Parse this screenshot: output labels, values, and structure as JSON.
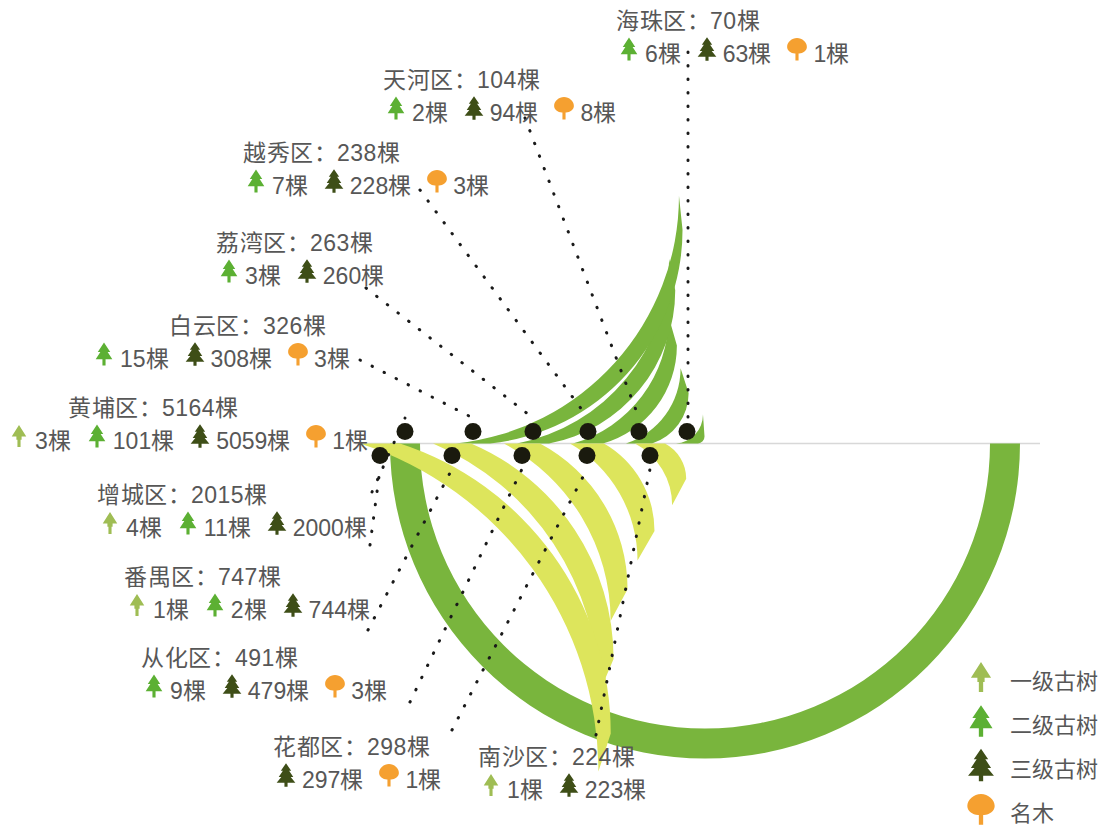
{
  "chart_data": {
    "type": "bar",
    "title": "",
    "subtitle": "",
    "xlabel": "",
    "ylabel": "",
    "legend_position": "bottom-right",
    "grid": false,
    "unit": "棵",
    "categories": [
      "黄埔区",
      "白云区",
      "荔湾区",
      "越秀区",
      "天河区",
      "海珠区",
      "增城区",
      "番禺区",
      "从化区",
      "花都区",
      "南沙区"
    ],
    "values": [
      5164,
      326,
      263,
      238,
      104,
      70,
      2015,
      747,
      491,
      298,
      224
    ],
    "series": [
      {
        "name": "一级古树",
        "color": "#9fbd54",
        "values": [
          3,
          0,
          0,
          0,
          0,
          0,
          4,
          1,
          0,
          0,
          1
        ]
      },
      {
        "name": "二级古树",
        "color": "#5cb033",
        "values": [
          101,
          15,
          3,
          7,
          2,
          6,
          11,
          2,
          9,
          0,
          0
        ]
      },
      {
        "name": "三级古树",
        "color": "#3e4e17",
        "values": [
          5059,
          308,
          260,
          228,
          94,
          63,
          2000,
          744,
          479,
          297,
          223
        ]
      },
      {
        "name": "名木",
        "color": "#f5a030",
        "values": [
          1,
          3,
          0,
          3,
          8,
          1,
          0,
          0,
          3,
          1,
          0
        ]
      }
    ]
  },
  "legend": {
    "items": [
      {
        "label": "一级古树",
        "icon": "tree-level1-icon",
        "color": "#9fbd54"
      },
      {
        "label": "二级古树",
        "icon": "tree-level2-icon",
        "color": "#5cb033"
      },
      {
        "label": "三级古树",
        "icon": "tree-level3-icon",
        "color": "#3e4e17"
      },
      {
        "label": "名木",
        "icon": "famous-tree-icon",
        "color": "#f5a030"
      }
    ]
  },
  "districts": [
    {
      "key": "haizhu",
      "title": "海珠区：70棵",
      "total": 70,
      "arc_color": "#79b53d",
      "breakdown": [
        {
          "level": "二级古树",
          "icon": "tree-level2-icon",
          "color": "#5cb033",
          "text": "6棵"
        },
        {
          "level": "三级古树",
          "icon": "tree-level3-icon",
          "color": "#3e4e17",
          "text": "63棵"
        },
        {
          "level": "名木",
          "icon": "famous-tree-icon",
          "color": "#f5a030",
          "text": "1棵"
        }
      ]
    },
    {
      "key": "tianhe",
      "title": "天河区：104棵",
      "total": 104,
      "arc_color": "#79b53d",
      "breakdown": [
        {
          "level": "二级古树",
          "icon": "tree-level2-icon",
          "color": "#5cb033",
          "text": "2棵"
        },
        {
          "level": "三级古树",
          "icon": "tree-level3-icon",
          "color": "#3e4e17",
          "text": "94棵"
        },
        {
          "level": "名木",
          "icon": "famous-tree-icon",
          "color": "#f5a030",
          "text": "8棵"
        }
      ]
    },
    {
      "key": "yuexiu",
      "title": "越秀区：238棵",
      "total": 238,
      "arc_color": "#79b53d",
      "breakdown": [
        {
          "level": "二级古树",
          "icon": "tree-level2-icon",
          "color": "#5cb033",
          "text": "7棵"
        },
        {
          "level": "三级古树",
          "icon": "tree-level3-icon",
          "color": "#3e4e17",
          "text": "228棵"
        },
        {
          "level": "名木",
          "icon": "famous-tree-icon",
          "color": "#f5a030",
          "text": "3棵"
        }
      ]
    },
    {
      "key": "liwan",
      "title": "荔湾区：263棵",
      "total": 263,
      "arc_color": "#79b53d",
      "breakdown": [
        {
          "level": "二级古树",
          "icon": "tree-level2-icon",
          "color": "#5cb033",
          "text": "3棵"
        },
        {
          "level": "三级古树",
          "icon": "tree-level3-icon",
          "color": "#3e4e17",
          "text": "260棵"
        }
      ]
    },
    {
      "key": "baiyun",
      "title": "白云区：326棵",
      "total": 326,
      "arc_color": "#79b53d",
      "breakdown": [
        {
          "level": "二级古树",
          "icon": "tree-level2-icon",
          "color": "#5cb033",
          "text": "15棵"
        },
        {
          "level": "三级古树",
          "icon": "tree-level3-icon",
          "color": "#3e4e17",
          "text": "308棵"
        },
        {
          "level": "名木",
          "icon": "famous-tree-icon",
          "color": "#f5a030",
          "text": "3棵"
        }
      ]
    },
    {
      "key": "huangpu",
      "title": "黄埔区：5164棵",
      "total": 5164,
      "arc_color": "#79b53d",
      "breakdown": [
        {
          "level": "一级古树",
          "icon": "tree-level1-icon",
          "color": "#9fbd54",
          "text": "3棵"
        },
        {
          "level": "二级古树",
          "icon": "tree-level2-icon",
          "color": "#5cb033",
          "text": "101棵"
        },
        {
          "level": "三级古树",
          "icon": "tree-level3-icon",
          "color": "#3e4e17",
          "text": "5059棵"
        },
        {
          "level": "名木",
          "icon": "famous-tree-icon",
          "color": "#f5a030",
          "text": "1棵"
        }
      ]
    },
    {
      "key": "zengcheng",
      "title": "增城区：2015棵",
      "total": 2015,
      "arc_color": "#dde55c",
      "breakdown": [
        {
          "level": "一级古树",
          "icon": "tree-level1-icon",
          "color": "#9fbd54",
          "text": "4棵"
        },
        {
          "level": "二级古树",
          "icon": "tree-level2-icon",
          "color": "#5cb033",
          "text": "11棵"
        },
        {
          "level": "三级古树",
          "icon": "tree-level3-icon",
          "color": "#3e4e17",
          "text": "2000棵"
        }
      ]
    },
    {
      "key": "panyu",
      "title": "番禺区：747棵",
      "total": 747,
      "arc_color": "#dde55c",
      "breakdown": [
        {
          "level": "一级古树",
          "icon": "tree-level1-icon",
          "color": "#9fbd54",
          "text": "1棵"
        },
        {
          "level": "二级古树",
          "icon": "tree-level2-icon",
          "color": "#5cb033",
          "text": "2棵"
        },
        {
          "level": "三级古树",
          "icon": "tree-level3-icon",
          "color": "#3e4e17",
          "text": "744棵"
        }
      ]
    },
    {
      "key": "conghua",
      "title": "从化区：491棵",
      "total": 491,
      "arc_color": "#dde55c",
      "breakdown": [
        {
          "level": "二级古树",
          "icon": "tree-level2-icon",
          "color": "#5cb033",
          "text": "9棵"
        },
        {
          "level": "三级古树",
          "icon": "tree-level3-icon",
          "color": "#3e4e17",
          "text": "479棵"
        },
        {
          "level": "名木",
          "icon": "famous-tree-icon",
          "color": "#f5a030",
          "text": "3棵"
        }
      ]
    },
    {
      "key": "huadu",
      "title": "花都区：298棵",
      "total": 298,
      "arc_color": "#dde55c",
      "breakdown": [
        {
          "level": "三级古树",
          "icon": "tree-level3-icon",
          "color": "#3e4e17",
          "text": "297棵"
        },
        {
          "level": "名木",
          "icon": "famous-tree-icon",
          "color": "#f5a030",
          "text": "1棵"
        }
      ]
    },
    {
      "key": "nansha",
      "title": "南沙区：224棵",
      "total": 224,
      "arc_color": "#dde55c",
      "breakdown": [
        {
          "level": "一级古树",
          "icon": "tree-level1-icon",
          "color": "#9fbd54",
          "text": "1棵"
        },
        {
          "level": "三级古树",
          "icon": "tree-level3-icon",
          "color": "#3e4e17",
          "text": "223棵"
        }
      ]
    }
  ]
}
